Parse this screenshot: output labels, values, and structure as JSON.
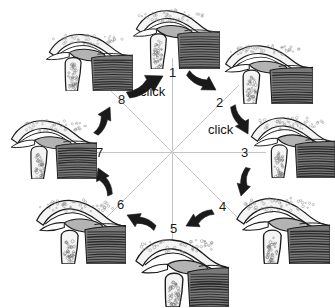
{
  "figure": {
    "type": "cycle-diagram",
    "background_color": "#ffffff",
    "ink_color": "#1b1b1b",
    "spoke_color": "#bdbdbd",
    "arrow_color": "#1a1a1a",
    "disc_fill": "#b3b3b3",
    "bone_fill": "#f4f4f4",
    "muscle_fill": "#7a7a7a",
    "stipple_color": "#8a8a8a",
    "panel_count": 8
  },
  "center": {
    "x": 172,
    "y": 152
  },
  "spokes": [
    {
      "name": "spoke-1-5",
      "x1": 172,
      "y1": 58,
      "x2": 172,
      "y2": 246,
      "color": "#c4c4c4"
    },
    {
      "name": "spoke-3-7",
      "x1": 78,
      "y1": 152,
      "x2": 266,
      "y2": 152,
      "color": "#c4c4c4"
    },
    {
      "name": "spoke-2-6",
      "x1": 105,
      "y1": 219,
      "x2": 239,
      "y2": 85,
      "color": "#c9c9c9"
    },
    {
      "name": "spoke-4-8",
      "x1": 105,
      "y1": 85,
      "x2": 239,
      "y2": 219,
      "color": "#c9c9c9"
    }
  ],
  "labels": {
    "numbers": [
      {
        "id": "position-1",
        "text": "1",
        "x": 169,
        "y": 66
      },
      {
        "id": "position-2",
        "text": "2",
        "x": 216,
        "y": 96
      },
      {
        "id": "position-3",
        "text": "3",
        "x": 241,
        "y": 146
      },
      {
        "id": "position-4",
        "text": "4",
        "x": 219,
        "y": 200
      },
      {
        "id": "position-5",
        "text": "5",
        "x": 170,
        "y": 222
      },
      {
        "id": "position-6",
        "text": "6",
        "x": 117,
        "y": 198
      },
      {
        "id": "position-7",
        "text": "7",
        "x": 96,
        "y": 146
      },
      {
        "id": "position-8",
        "text": "8",
        "x": 118,
        "y": 93
      }
    ],
    "clicks": [
      {
        "id": "click-label-top",
        "text": "click",
        "x": 140,
        "y": 85
      },
      {
        "id": "click-label-right",
        "text": "click",
        "x": 208,
        "y": 123
      }
    ]
  },
  "arrows": [
    {
      "id": "arrow-8-to-1",
      "from": "8",
      "to": "1",
      "direction": "up-right",
      "tail": [
        128,
        95
      ],
      "head": [
        163,
        76
      ]
    },
    {
      "id": "arrow-1-to-2",
      "from": "1",
      "to": "2",
      "direction": "down-right",
      "tail": [
        188,
        73
      ],
      "head": [
        216,
        90
      ]
    },
    {
      "id": "arrow-2-to-3",
      "from": "2",
      "to": "3",
      "direction": "down-right",
      "tail": [
        233,
        106
      ],
      "head": [
        248,
        134
      ]
    },
    {
      "id": "arrow-3-to-4",
      "from": "3",
      "to": "4",
      "direction": "down",
      "tail": [
        248,
        168
      ],
      "head": [
        241,
        196
      ]
    },
    {
      "id": "arrow-4-to-5",
      "from": "4",
      "to": "5",
      "direction": "down-left",
      "tail": [
        213,
        212
      ],
      "head": [
        186,
        226
      ]
    },
    {
      "id": "arrow-5-to-6",
      "from": "5",
      "to": "6",
      "direction": "left",
      "tail": [
        155,
        228
      ],
      "head": [
        127,
        215
      ]
    },
    {
      "id": "arrow-6-to-7",
      "from": "6",
      "to": "7",
      "direction": "up-left",
      "tail": [
        110,
        195
      ],
      "head": [
        98,
        168
      ]
    },
    {
      "id": "arrow-7-to-8",
      "from": "7",
      "to": "8",
      "direction": "up-right",
      "tail": [
        96,
        134
      ],
      "head": [
        110,
        107
      ]
    }
  ],
  "panels": [
    {
      "id": "panel-1",
      "position": "1",
      "x": 132,
      "y": 3,
      "w": 88,
      "h": 66,
      "rotation": 0,
      "mirrored": false
    },
    {
      "id": "panel-2",
      "position": "2",
      "x": 221,
      "y": 38,
      "w": 92,
      "h": 66,
      "rotation": 0,
      "mirrored": false
    },
    {
      "id": "panel-3",
      "position": "3",
      "x": 247,
      "y": 110,
      "w": 88,
      "h": 68,
      "rotation": 0,
      "mirrored": false
    },
    {
      "id": "panel-4",
      "position": "4",
      "x": 232,
      "y": 190,
      "w": 98,
      "h": 74,
      "rotation": 0,
      "mirrored": false
    },
    {
      "id": "panel-5",
      "position": "5",
      "x": 131,
      "y": 231,
      "w": 98,
      "h": 76,
      "rotation": 0,
      "mirrored": false
    },
    {
      "id": "panel-6",
      "position": "6",
      "x": 32,
      "y": 192,
      "w": 94,
      "h": 72,
      "rotation": 0,
      "mirrored": false
    },
    {
      "id": "panel-7",
      "position": "7",
      "x": 7,
      "y": 113,
      "w": 90,
      "h": 66,
      "rotation": 0,
      "mirrored": false
    },
    {
      "id": "panel-8",
      "position": "8",
      "x": 45,
      "y": 27,
      "w": 88,
      "h": 64,
      "rotation": 0,
      "mirrored": false
    }
  ]
}
